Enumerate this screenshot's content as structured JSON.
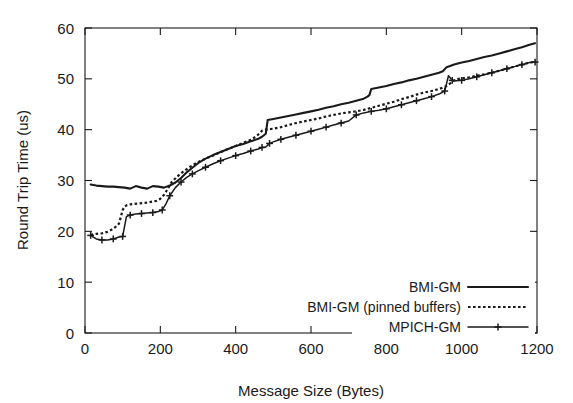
{
  "chart_data": {
    "type": "line",
    "title": "",
    "xlabel": "Message Size (Bytes)",
    "ylabel": "Round Trip Time (us)",
    "xlim": [
      0,
      1200
    ],
    "ylim": [
      0,
      60
    ],
    "xticks": [
      0,
      200,
      400,
      600,
      800,
      1000,
      1200
    ],
    "yticks": [
      0,
      10,
      20,
      30,
      40,
      50,
      60
    ],
    "grid": false,
    "legend_position": "lower right",
    "series": [
      {
        "name": "BMI-GM",
        "style": "solid",
        "marker": "none",
        "color": "#1a1a1a",
        "x": [
          15,
          30,
          45,
          60,
          75,
          90,
          105,
          120,
          135,
          150,
          165,
          180,
          195,
          210,
          225,
          240,
          255,
          270,
          285,
          300,
          320,
          340,
          360,
          380,
          400,
          420,
          440,
          460,
          470,
          480,
          485,
          500,
          520,
          540,
          560,
          580,
          600,
          620,
          640,
          660,
          680,
          700,
          720,
          740,
          750,
          755,
          760,
          780,
          800,
          820,
          840,
          860,
          880,
          900,
          920,
          940,
          950,
          960,
          980,
          1000,
          1020,
          1040,
          1060,
          1080,
          1100,
          1120,
          1140,
          1160,
          1180,
          1195
        ],
        "y": [
          29.2,
          29.0,
          28.9,
          28.8,
          28.8,
          28.7,
          28.6,
          28.4,
          28.9,
          28.6,
          28.4,
          28.9,
          28.8,
          28.6,
          29.0,
          29.6,
          30.5,
          31.6,
          32.5,
          33.4,
          34.3,
          35.0,
          35.6,
          36.2,
          36.8,
          37.2,
          37.7,
          38.2,
          38.6,
          39.2,
          41.9,
          42.1,
          42.4,
          42.7,
          43.0,
          43.3,
          43.6,
          43.9,
          44.3,
          44.6,
          45.0,
          45.3,
          45.7,
          46.1,
          46.5,
          46.8,
          48.0,
          48.3,
          48.6,
          49.0,
          49.3,
          49.7,
          50.0,
          50.4,
          50.8,
          51.2,
          51.5,
          52.3,
          52.8,
          53.2,
          53.5,
          53.9,
          54.3,
          54.6,
          55.0,
          55.4,
          55.8,
          56.2,
          56.7,
          57.0
        ]
      },
      {
        "name": "BMI-GM (pinned buffers)",
        "style": "dotted",
        "marker": "none",
        "color": "#1a1a1a",
        "x": [
          15,
          30,
          45,
          60,
          70,
          80,
          90,
          95,
          100,
          105,
          110,
          120,
          130,
          145,
          160,
          175,
          190,
          200,
          210,
          220,
          230,
          245,
          260,
          275,
          290,
          305,
          320,
          340,
          360,
          380,
          400,
          420,
          440,
          455,
          465,
          470,
          480,
          490,
          500,
          520,
          540,
          560,
          580,
          600,
          620,
          640,
          660,
          680,
          700,
          720,
          740,
          760,
          780,
          800,
          820,
          840,
          860,
          880,
          900,
          920,
          940,
          960,
          975,
          985,
          1000,
          1020,
          1040,
          1060,
          1080,
          1100,
          1120,
          1140,
          1160,
          1180,
          1195
        ],
        "y": [
          19.3,
          19.5,
          19.6,
          19.9,
          20.3,
          20.8,
          21.5,
          22.8,
          24.2,
          24.9,
          25.1,
          25.3,
          25.4,
          25.5,
          25.6,
          25.8,
          26.0,
          26.4,
          27.2,
          28.4,
          29.7,
          30.8,
          31.7,
          32.5,
          33.2,
          33.8,
          34.3,
          34.9,
          35.6,
          36.2,
          36.8,
          37.4,
          38.0,
          38.7,
          39.4,
          39.8,
          40.0,
          40.1,
          40.2,
          40.5,
          40.9,
          41.3,
          41.6,
          41.9,
          42.2,
          42.6,
          42.9,
          43.2,
          43.4,
          43.6,
          43.9,
          44.3,
          44.7,
          45.1,
          45.5,
          46.0,
          46.4,
          46.9,
          47.3,
          47.6,
          48.0,
          48.6,
          49.4,
          49.9,
          50.1,
          50.3,
          50.6,
          50.9,
          51.2,
          51.6,
          52.0,
          52.4,
          52.8,
          53.2,
          53.3
        ]
      },
      {
        "name": "MPICH-GM",
        "style": "solid",
        "marker": "plus",
        "color": "#1a1a1a",
        "x": [
          15,
          30,
          45,
          60,
          75,
          90,
          100,
          110,
          120,
          135,
          150,
          165,
          180,
          195,
          205,
          215,
          225,
          240,
          255,
          270,
          285,
          300,
          320,
          340,
          360,
          380,
          400,
          420,
          440,
          460,
          470,
          480,
          490,
          500,
          520,
          540,
          560,
          580,
          600,
          620,
          640,
          660,
          680,
          700,
          720,
          740,
          760,
          780,
          800,
          820,
          840,
          860,
          880,
          900,
          920,
          940,
          955,
          965,
          975,
          985,
          1000,
          1020,
          1040,
          1060,
          1080,
          1100,
          1120,
          1140,
          1160,
          1180,
          1195
        ],
        "y": [
          19.2,
          18.5,
          18.3,
          18.3,
          18.5,
          18.9,
          19.0,
          22.9,
          23.2,
          23.4,
          23.5,
          23.6,
          23.7,
          23.9,
          24.2,
          25.4,
          27.0,
          28.6,
          29.7,
          30.6,
          31.3,
          31.9,
          32.6,
          33.3,
          33.9,
          34.4,
          34.9,
          35.3,
          35.8,
          36.2,
          36.5,
          36.6,
          37.3,
          37.6,
          38.1,
          38.5,
          38.9,
          39.3,
          39.7,
          40.1,
          40.5,
          40.9,
          41.3,
          41.7,
          42.9,
          43.3,
          43.6,
          43.8,
          44.1,
          44.5,
          44.9,
          45.3,
          45.7,
          46.1,
          46.5,
          47.0,
          47.6,
          50.6,
          49.7,
          49.6,
          49.7,
          50.0,
          50.4,
          50.8,
          51.2,
          51.6,
          52.0,
          52.4,
          52.8,
          53.2,
          53.3
        ]
      }
    ],
    "legend": [
      {
        "label": "BMI-GM",
        "style": "solid",
        "marker": "none"
      },
      {
        "label": "BMI-GM (pinned buffers)",
        "style": "dotted",
        "marker": "none"
      },
      {
        "label": "MPICH-GM",
        "style": "solid",
        "marker": "plus"
      }
    ]
  }
}
